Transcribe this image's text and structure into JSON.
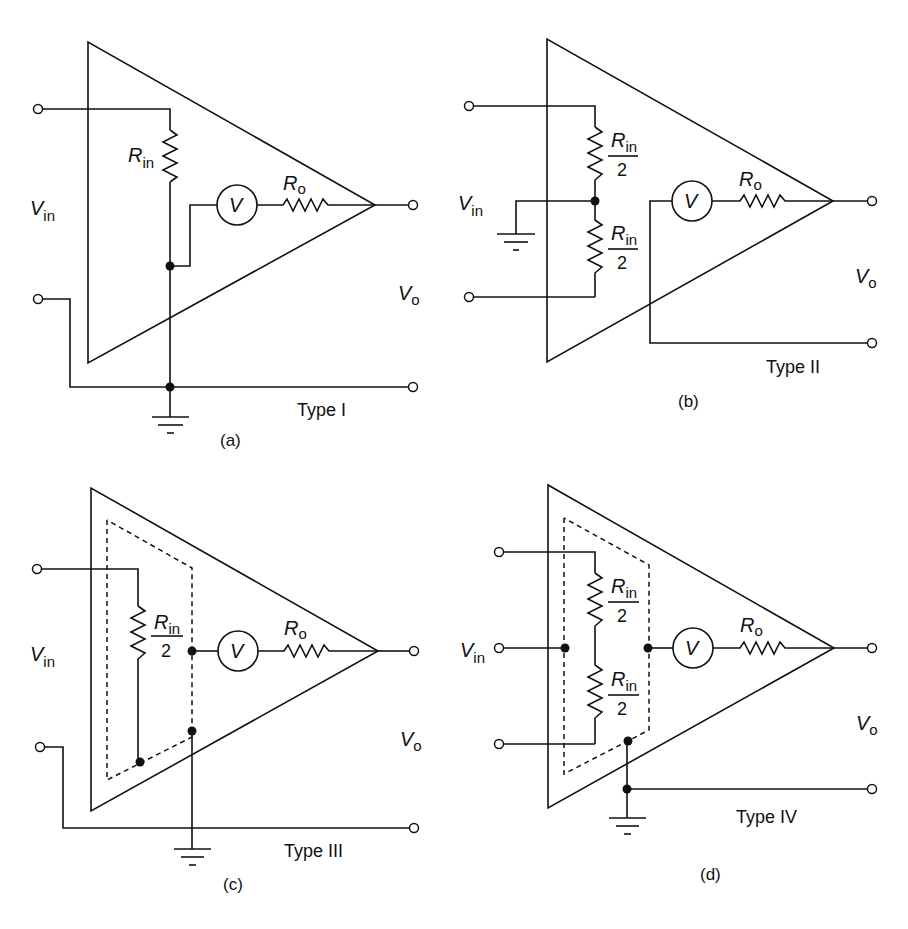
{
  "figure": {
    "panels": [
      {
        "id": "a",
        "caption": "(a)",
        "type_label": "Type I",
        "input_label": "V",
        "input_sub": "in",
        "output_label": "V",
        "output_sub": "o",
        "rin_label": "R",
        "rin_sub": "in",
        "ro_label": "R",
        "ro_sub": "o",
        "meter_label": "V"
      },
      {
        "id": "b",
        "caption": "(b)",
        "type_label": "Type II",
        "input_label": "V",
        "input_sub": "in",
        "output_label": "V",
        "output_sub": "o",
        "rin_top_label": "R",
        "rin_top_sub": "in",
        "rin_top_den": "2",
        "rin_bot_label": "R",
        "rin_bot_sub": "in",
        "rin_bot_den": "2",
        "ro_label": "R",
        "ro_sub": "o",
        "meter_label": "V"
      },
      {
        "id": "c",
        "caption": "(c)",
        "type_label": "Type III",
        "input_label": "V",
        "input_sub": "in",
        "output_label": "V",
        "output_sub": "o",
        "rin_label": "R",
        "rin_sub": "in",
        "rin_den": "2",
        "ro_label": "R",
        "ro_sub": "o",
        "meter_label": "V"
      },
      {
        "id": "d",
        "caption": "(d)",
        "type_label": "Type IV",
        "input_label": "V",
        "input_sub": "in",
        "output_label": "V",
        "output_sub": "o",
        "rin_top_label": "R",
        "rin_top_sub": "in",
        "rin_top_den": "2",
        "rin_bot_label": "R",
        "rin_bot_sub": "in",
        "rin_bot_den": "2",
        "ro_label": "R",
        "ro_sub": "o",
        "meter_label": "V"
      }
    ]
  }
}
